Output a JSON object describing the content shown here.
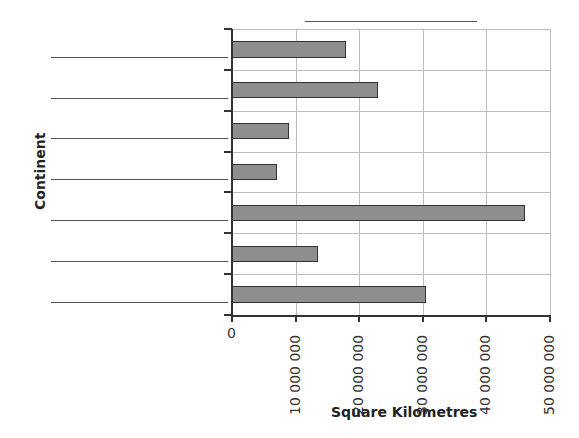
{
  "chart_data": {
    "type": "bar",
    "orientation": "horizontal",
    "title": "",
    "categories": [
      "",
      "",
      "",
      "",
      "",
      "",
      ""
    ],
    "values": [
      18000000,
      23000000,
      9000000,
      7000000,
      46000000,
      13500000,
      30500000
    ],
    "xlabel": "Square Kilometres",
    "ylabel": "Continent",
    "xlim": [
      0,
      50000000
    ],
    "xticks": [
      0,
      10000000,
      20000000,
      30000000,
      40000000,
      50000000
    ],
    "xtick_labels": [
      "0",
      "10 000 000",
      "20 000 000",
      "30 000 000",
      "40 000 000",
      "50 000 000"
    ],
    "grid": true,
    "legend": null,
    "bar_color": "#8e8e8e",
    "bar_edge_color": "#333333"
  },
  "axes": {
    "xlabel": "Square Kilometres",
    "ylabel": "Continent"
  }
}
